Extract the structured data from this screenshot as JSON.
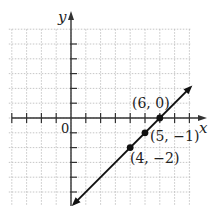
{
  "graph": {
    "x_axis_label": "x",
    "y_axis_label": "y",
    "origin_label": "0",
    "grid": {
      "xmin": -4,
      "xmax": 8,
      "ymin": -6,
      "ymax": 6,
      "step": 1
    },
    "line": {
      "equation": "y = x - 6",
      "slope": 1,
      "intercept": -6
    },
    "points": [
      {
        "x": 6,
        "y": 0,
        "label": "(6, 0)"
      },
      {
        "x": 5,
        "y": -1,
        "label": "(5, −1)"
      },
      {
        "x": 4,
        "y": -2,
        "label": "(4, −2)"
      }
    ],
    "colors": {
      "grid": "#b8b8b8",
      "axis": "#333333",
      "line": "#111111"
    }
  }
}
